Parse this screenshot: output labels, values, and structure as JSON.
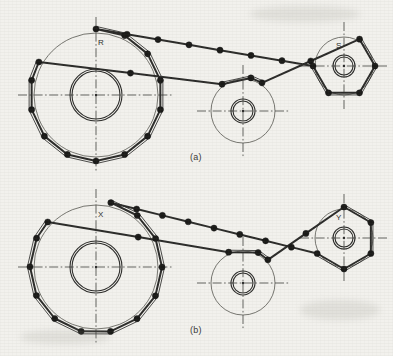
{
  "figure": {
    "background_color": "#f2f1ed",
    "line_color": "#2b2b29",
    "pin_color": "#1a1a18",
    "centerline_color": "#4a4a46",
    "thin_line_color": "#55554f"
  },
  "labels": {
    "caption_a": "(a)",
    "caption_b": "(b)",
    "point_R": "R",
    "point_S": "S",
    "point_X": "X",
    "point_Y": "Y"
  },
  "diagrams": [
    {
      "id": "a",
      "caption": "(a)",
      "sprockets": [
        {
          "name": "large-driver-sprocket",
          "label": "R",
          "label_x": 96,
          "label_y": 43,
          "cx": 96,
          "cy": 95,
          "outer_radius": 62,
          "pitch_radius": 66,
          "bore_outer_radius": 26,
          "bore_inner_radius": 24,
          "teeth": 14,
          "phase_deg": -90,
          "centerline_h_half": 78,
          "centerline_v_half": 78
        },
        {
          "name": "idler-sprocket",
          "label": "",
          "cx": 243,
          "cy": 111,
          "outer_radius": 32,
          "pitch_radius": 34,
          "bore_outer_radius": 12,
          "bore_inner_radius": 10,
          "teeth": 7,
          "phase_deg": -90,
          "centerline_h_half": 46,
          "centerline_v_half": 46
        },
        {
          "name": "small-driven-sprocket",
          "label": "S",
          "label_x": 344,
          "label_y": 46,
          "cx": 344,
          "cy": 66,
          "outer_radius": 29,
          "pitch_radius": 31,
          "bore_outer_radius": 11,
          "bore_inner_radius": 9,
          "teeth": 6,
          "phase_deg": 0,
          "centerline_h_half": 44,
          "centerline_v_half": 44
        }
      ],
      "chain": {
        "pin_radius": 3.1,
        "top_run_pins": 6,
        "description": "Chain wraps large sprocket counterclockwise, passes over idler, wraps small sprocket"
      }
    },
    {
      "id": "b",
      "caption": "(b)",
      "sprockets": [
        {
          "name": "large-driver-sprocket",
          "label": "X",
          "label_x": 96,
          "label_y": 215,
          "cx": 96,
          "cy": 267,
          "outer_radius": 62,
          "pitch_radius": 66,
          "bore_outer_radius": 26,
          "bore_inner_radius": 24,
          "teeth": 14,
          "phase_deg": -77,
          "centerline_h_half": 78,
          "centerline_v_half": 78
        },
        {
          "name": "idler-sprocket",
          "label": "",
          "cx": 243,
          "cy": 283,
          "outer_radius": 32,
          "pitch_radius": 34,
          "bore_outer_radius": 12,
          "bore_inner_radius": 10,
          "teeth": 7,
          "phase_deg": -77,
          "centerline_h_half": 46,
          "centerline_v_half": 46
        },
        {
          "name": "small-driven-sprocket",
          "label": "Y",
          "label_x": 344,
          "label_y": 218,
          "cx": 344,
          "cy": 238,
          "outer_radius": 29,
          "pitch_radius": 31,
          "bore_outer_radius": 11,
          "bore_inner_radius": 9,
          "teeth": 6,
          "phase_deg": -30,
          "centerline_h_half": 44,
          "centerline_v_half": 44
        }
      ],
      "chain": {
        "pin_radius": 3.1,
        "top_run_pins": 7,
        "description": "Same drive advanced by half a chain pitch relative to (a)"
      }
    }
  ]
}
